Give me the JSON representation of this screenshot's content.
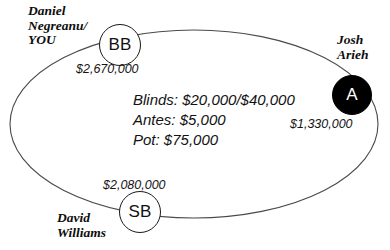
{
  "diagram": {
    "table": {
      "shape": "ellipse",
      "fill": "#ffffff",
      "stroke": "#4a4a4a"
    },
    "seats": [
      {
        "id": "bb",
        "position_label": "BB",
        "player_name": "Daniel\nNegreanu/\nYOU",
        "chip_stack": "$2,670,000",
        "marker_style": "open",
        "marker_fill": "#ffffff",
        "marker_text_color": "#111111"
      },
      {
        "id": "a",
        "position_label": "A",
        "player_name": "Josh\nArieh",
        "chip_stack": "$1,330,000",
        "marker_style": "filled",
        "marker_fill": "#000000",
        "marker_text_color": "#ffffff"
      },
      {
        "id": "sb",
        "position_label": "SB",
        "player_name": "David\nWilliams",
        "chip_stack": "$2,080,000",
        "marker_style": "open",
        "marker_fill": "#ffffff",
        "marker_text_color": "#111111"
      }
    ],
    "pot_info": {
      "blinds_line": "Blinds: $20,000/$40,000",
      "antes_line": "Antes: $5,000",
      "pot_line": "Pot: $75,000"
    }
  }
}
